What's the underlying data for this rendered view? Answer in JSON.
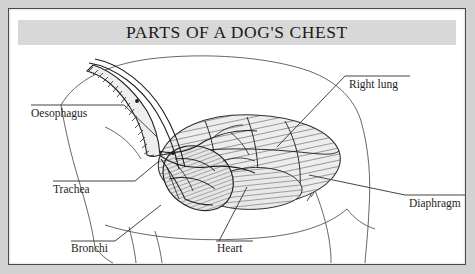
{
  "figure": {
    "title": "PARTS OF A DOG'S CHEST",
    "title_band_color": "#d8d8d8",
    "frame_color": "#4a4a4a",
    "page_color": "#ffffff",
    "margin_color": "#d2d2d2",
    "ink_color": "#2b2b2b",
    "illustration_type": "pen-and-ink anatomical cutaway of a dog's thorax in left lateral view"
  },
  "labels": [
    {
      "id": "oesophagus",
      "text": "Oesophagus",
      "side": "left",
      "text_x": 22,
      "text_y": 108,
      "rule": [
        22,
        96,
        115,
        96
      ],
      "leader": [
        115,
        96,
        148,
        128
      ]
    },
    {
      "id": "trachea",
      "text": "Trachea",
      "side": "left",
      "text_x": 44,
      "text_y": 184,
      "rule": [
        44,
        172,
        126,
        172
      ],
      "leader": [
        126,
        172,
        150,
        152
      ]
    },
    {
      "id": "bronchi",
      "text": "Bronchi",
      "side": "bottom",
      "text_x": 62,
      "text_y": 243,
      "rule": [
        62,
        232,
        106,
        232
      ],
      "leader": [
        106,
        232,
        152,
        196
      ]
    },
    {
      "id": "heart",
      "text": "Heart",
      "side": "bottom",
      "text_x": 208,
      "text_y": 243,
      "rule": [
        207,
        232,
        244,
        232
      ],
      "leader": [
        210,
        232,
        238,
        178
      ]
    },
    {
      "id": "right-lung",
      "text": "Right lung",
      "side": "right",
      "text_x": 340,
      "text_y": 79,
      "rule": [
        336,
        67,
        401,
        67
      ],
      "leader": [
        336,
        67,
        268,
        138
      ]
    },
    {
      "id": "diaphragm",
      "text": "Diaphragm",
      "side": "right",
      "text_x": 400,
      "text_y": 198,
      "rule": [
        396,
        186,
        460,
        186
      ],
      "leader": [
        396,
        186,
        300,
        166
      ]
    }
  ],
  "structures": [
    {
      "id": "body-outline",
      "name": "dog body outline (neck, back, foreleg, belly)"
    },
    {
      "id": "trachea-tube",
      "name": "trachea with cartilage rings"
    },
    {
      "id": "oesophagus-tube",
      "name": "oesophagus running above trachea"
    },
    {
      "id": "bronchi",
      "name": "bronchial tree branching from trachea"
    },
    {
      "id": "lung-lobes",
      "name": "right lung lobes with hatched shading"
    },
    {
      "id": "heart-mass",
      "name": "heart, rounded and finely hatched"
    },
    {
      "id": "diaphragm-line",
      "name": "diaphragm arching behind the lungs"
    }
  ]
}
